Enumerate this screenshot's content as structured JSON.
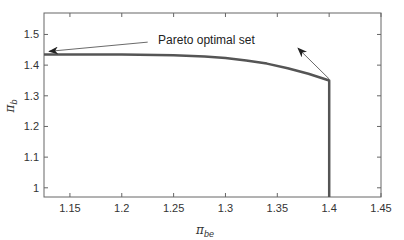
{
  "chart_data": {
    "type": "line",
    "title": "",
    "xlabel": "π_be",
    "ylabel": "π_b",
    "xlim": [
      1.125,
      1.45
    ],
    "ylim": [
      0.97,
      1.57
    ],
    "xticks": [
      1.15,
      1.2,
      1.25,
      1.3,
      1.35,
      1.4,
      1.45
    ],
    "yticks": [
      1.0,
      1.1,
      1.2,
      1.3,
      1.4,
      1.5
    ],
    "xtick_labels": [
      "1.15",
      "1.2",
      "1.25",
      "1.3",
      "1.35",
      "1.4",
      "1.45"
    ],
    "ytick_labels": [
      "1",
      "1.1",
      "1.2",
      "1.3",
      "1.4",
      "1.5"
    ],
    "grid": false,
    "series": [
      {
        "name": "Pareto optimal set",
        "x": [
          1.125,
          1.15,
          1.2,
          1.25,
          1.28,
          1.3,
          1.32,
          1.34,
          1.36,
          1.38,
          1.4,
          1.4,
          1.4
        ],
        "y": [
          1.435,
          1.435,
          1.435,
          1.432,
          1.428,
          1.423,
          1.415,
          1.405,
          1.39,
          1.372,
          1.35,
          1.2,
          0.97
        ],
        "color": "#555555"
      }
    ],
    "annotations": [
      {
        "text": "Pareto optimal set",
        "text_x": 1.235,
        "text_y": 1.47,
        "arrows": [
          {
            "from": [
              1.225,
              1.475
            ],
            "to": [
              1.13,
              1.445
            ]
          },
          {
            "from": [
              1.4,
              1.355
            ],
            "to": [
              1.37,
              1.455
            ]
          }
        ]
      }
    ]
  },
  "labels": {
    "x_main": "π",
    "x_sub": "be",
    "y_main": "π",
    "y_sub": "b",
    "annotation": "Pareto optimal set"
  }
}
